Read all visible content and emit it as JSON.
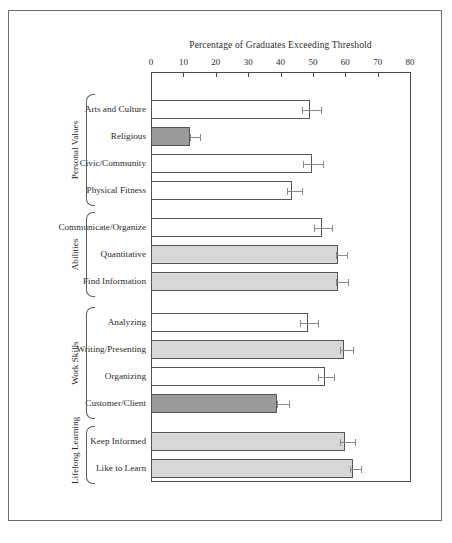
{
  "chart_data": {
    "type": "bar",
    "orientation": "horizontal",
    "title": "Percentage of Graduates Exceeding Threshold",
    "xlabel": "Percentage of Graduates Exceeding Threshold",
    "ylabel": "",
    "xlim": [
      0,
      80
    ],
    "xticks": [
      0,
      10,
      20,
      30,
      40,
      50,
      60,
      70,
      80
    ],
    "grid": false,
    "legend": "none",
    "error_bars": "horizontal caps at both ends of interval",
    "groups": [
      {
        "name": "Personal Values",
        "categories": [
          "Arts and Culture",
          "Religious",
          "Civic/Community",
          "Physical Fitness"
        ],
        "values": [
          49.0,
          12.0,
          49.7,
          43.5
        ],
        "err_low": [
          46.5,
          12.0,
          47.0,
          42.0
        ],
        "err_high": [
          52.5,
          15.0,
          53.0,
          46.5
        ],
        "fills": [
          "white",
          "dark",
          "white",
          "white"
        ]
      },
      {
        "name": "Abilities",
        "categories": [
          "Communicate/Organize",
          "Quantitative",
          "Find Information"
        ],
        "values": [
          52.8,
          57.7,
          57.7
        ],
        "err_low": [
          50.5,
          57.0,
          57.0
        ],
        "err_high": [
          56.0,
          60.5,
          61.0
        ],
        "fills": [
          "white",
          "light",
          "light"
        ]
      },
      {
        "name": "Work Skills",
        "categories": [
          "Analyzing",
          "Writing/Presenting",
          "Organizing",
          "Customer/Client"
        ],
        "values": [
          48.5,
          59.5,
          53.7,
          39.0
        ],
        "err_low": [
          46.0,
          58.5,
          51.5,
          39.0
        ],
        "err_high": [
          51.5,
          62.5,
          56.5,
          42.5
        ],
        "fills": [
          "white",
          "light",
          "white",
          "dark"
        ]
      },
      {
        "name": "Lifelong Learning",
        "categories": [
          "Keep Informed",
          "Like to Learn"
        ],
        "values": [
          60.0,
          62.3
        ],
        "err_low": [
          58.5,
          61.5
        ],
        "err_high": [
          63.0,
          65.0
        ],
        "fills": [
          "light",
          "light"
        ]
      }
    ]
  },
  "colors": {
    "bar_white": "#ffffff",
    "bar_light_gray": "#d8d8d8",
    "bar_dark_gray": "#9a9a9a",
    "bar_outline": "#565656",
    "axis": "#4a4a4a",
    "error_bar": "#8a8a8a",
    "frame": "#6d6d6d",
    "text": "#2b2b2b"
  }
}
